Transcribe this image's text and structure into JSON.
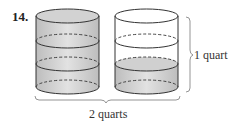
{
  "problem_number": "14.",
  "labels": {
    "right_brace": "1 quart",
    "bottom_brace": "2 quarts"
  },
  "cylinders": [
    {
      "name": "left",
      "divisions": 3,
      "filled_sections": 3
    },
    {
      "name": "right",
      "divisions": 3,
      "filled_sections": 1
    }
  ],
  "colors": {
    "fill": "#c8c8c8",
    "fill_light": "#e4e4e4",
    "stroke": "#333333"
  }
}
